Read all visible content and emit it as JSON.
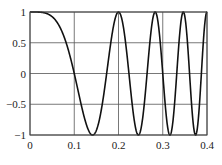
{
  "chart_data": {
    "type": "line",
    "title": "",
    "xlabel": "",
    "ylabel": "",
    "xlim": [
      0,
      0.4
    ],
    "ylim": [
      -1,
      1
    ],
    "grid": true,
    "legend": null,
    "x_ticks": [
      0,
      0.1,
      0.2,
      0.3,
      0.4
    ],
    "x_tick_labels": [
      "0",
      "0.1",
      "0.2",
      "0.3",
      "0.4"
    ],
    "y_ticks": [
      1,
      0.5,
      0,
      -0.5,
      -1
    ],
    "y_tick_labels": [
      "1",
      "0.5",
      "0",
      "−0.5",
      "−1"
    ],
    "series": [
      {
        "name": "chirp cos(50πt²)",
        "formula": "cos(50*pi*t^2)",
        "color": "#111111",
        "key_points": [
          {
            "x": 0,
            "y": 1
          },
          {
            "x": 0.1,
            "y": 0
          },
          {
            "x": 0.1414,
            "y": -1
          },
          {
            "x": 0.2,
            "y": 1
          },
          {
            "x": 0.2449,
            "y": -1
          },
          {
            "x": 0.2828,
            "y": 1
          },
          {
            "x": 0.3162,
            "y": -1
          },
          {
            "x": 0.3464,
            "y": 1
          },
          {
            "x": 0.3742,
            "y": -1
          },
          {
            "x": 0.4,
            "y": 1
          }
        ]
      }
    ]
  },
  "layout": {
    "plot_left": 30,
    "plot_right": 207,
    "plot_top": 12,
    "plot_bottom": 135,
    "line_color": "#111111",
    "grid_color": "#555555",
    "axis_color": "#444444"
  }
}
